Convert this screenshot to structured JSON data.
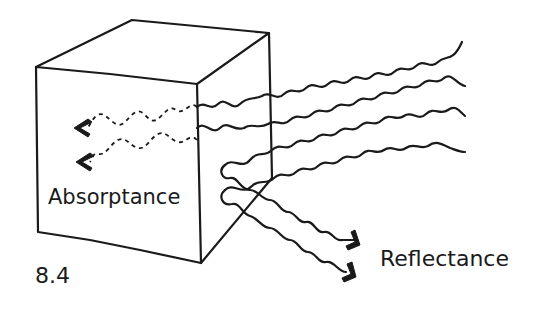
{
  "figure": {
    "number": "8.4",
    "labels": {
      "absorptance": "Absorptance",
      "reflectance": "Reflectance"
    },
    "colors": {
      "ink": "#1a1a1a",
      "background": "#ffffff"
    },
    "elements": {
      "cube": "cube-drawing",
      "incoming_waves": 4,
      "absorbed_waves": 2,
      "reflected_waves": 2
    }
  }
}
